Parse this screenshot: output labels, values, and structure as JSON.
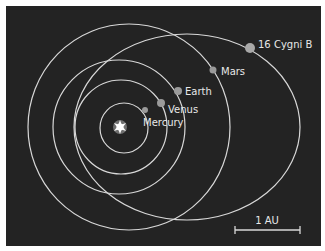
{
  "diagram": {
    "title": "",
    "background_color": "#232323",
    "orbit_color": "#d8d8d8",
    "planet_color": "#9a9a9a",
    "star": {
      "name": "Sun",
      "icon": "star-burst-icon"
    },
    "bodies": [
      {
        "name": "Mercury",
        "label": "Mercury"
      },
      {
        "name": "Venus",
        "label": "Venus"
      },
      {
        "name": "Earth",
        "label": "Earth"
      },
      {
        "name": "Mars",
        "label": "Mars"
      },
      {
        "name": "16 Cygni B",
        "label": "16 Cygni B"
      }
    ],
    "scale_bar": {
      "label": "1 AU"
    }
  }
}
